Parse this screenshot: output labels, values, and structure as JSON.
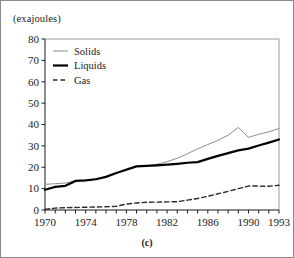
{
  "figure": {
    "caption": "(c)",
    "y_unit_label": "(exajoules)"
  },
  "legend": {
    "position": "top-left-inside",
    "items": [
      {
        "label": "Solids",
        "style": "thin-solid",
        "color": "#8d8d8d"
      },
      {
        "label": "Liquids",
        "style": "thick-solid",
        "color": "#000000"
      },
      {
        "label": "Gas",
        "style": "dashed",
        "color": "#2b2b2b"
      }
    ]
  },
  "chart_data": {
    "type": "line",
    "title": "",
    "xlabel": "",
    "ylabel": "(exajoules)",
    "xlim": [
      1970,
      1993
    ],
    "ylim": [
      0,
      80
    ],
    "ytick_values": [
      0,
      10,
      20,
      30,
      40,
      50,
      60,
      70,
      80
    ],
    "ytick_labels": [
      "0",
      "10",
      "20",
      "30",
      "40",
      "50",
      "60",
      "70",
      "80"
    ],
    "xtick_values": [
      1970,
      1971,
      1972,
      1973,
      1974,
      1975,
      1976,
      1977,
      1978,
      1979,
      1980,
      1981,
      1982,
      1983,
      1984,
      1985,
      1986,
      1987,
      1988,
      1989,
      1990,
      1991,
      1992,
      1993
    ],
    "xtick_labels_shown": [
      "1970",
      "1974",
      "1978",
      "1982",
      "1986",
      "1990",
      "1993"
    ],
    "xtick_labels_shown_values": [
      1970,
      1974,
      1978,
      1982,
      1986,
      1990,
      1993
    ],
    "grid": false,
    "legend_position": "upper left",
    "x": [
      1970,
      1971,
      1972,
      1973,
      1974,
      1975,
      1976,
      1977,
      1978,
      1979,
      1980,
      1981,
      1982,
      1983,
      1984,
      1985,
      1986,
      1987,
      1988,
      1989,
      1990,
      1991,
      1992,
      1993
    ],
    "series": [
      {
        "name": "Solids",
        "color": "#8d8d8d",
        "linestyle": "solid",
        "linewidth": 1,
        "values": [
          12.0,
          12.3,
          12.6,
          13.7,
          13.9,
          14.6,
          15.6,
          17.0,
          19.3,
          20.6,
          20.8,
          21.4,
          22.6,
          24.2,
          26.3,
          28.6,
          30.6,
          32.6,
          35.0,
          38.6,
          34.0,
          35.4,
          36.6,
          38.1
        ]
      },
      {
        "name": "Liquids",
        "color": "#000000",
        "linestyle": "solid",
        "linewidth": 2.2,
        "values": [
          9.5,
          10.8,
          11.3,
          13.6,
          13.9,
          14.4,
          15.5,
          17.3,
          18.8,
          20.4,
          20.6,
          20.9,
          21.2,
          21.6,
          22.1,
          22.4,
          23.9,
          25.3,
          26.6,
          27.9,
          28.7,
          30.2,
          31.5,
          33.0
        ]
      },
      {
        "name": "Gas",
        "color": "#2b2b2b",
        "linestyle": "dashed",
        "linewidth": 1.4,
        "values": [
          0.3,
          0.9,
          1.1,
          1.2,
          1.3,
          1.4,
          1.5,
          1.7,
          2.8,
          3.3,
          3.6,
          3.7,
          3.8,
          3.9,
          4.6,
          5.4,
          6.4,
          7.6,
          8.7,
          10.0,
          11.2,
          11.2,
          11.1,
          11.6
        ]
      }
    ]
  }
}
